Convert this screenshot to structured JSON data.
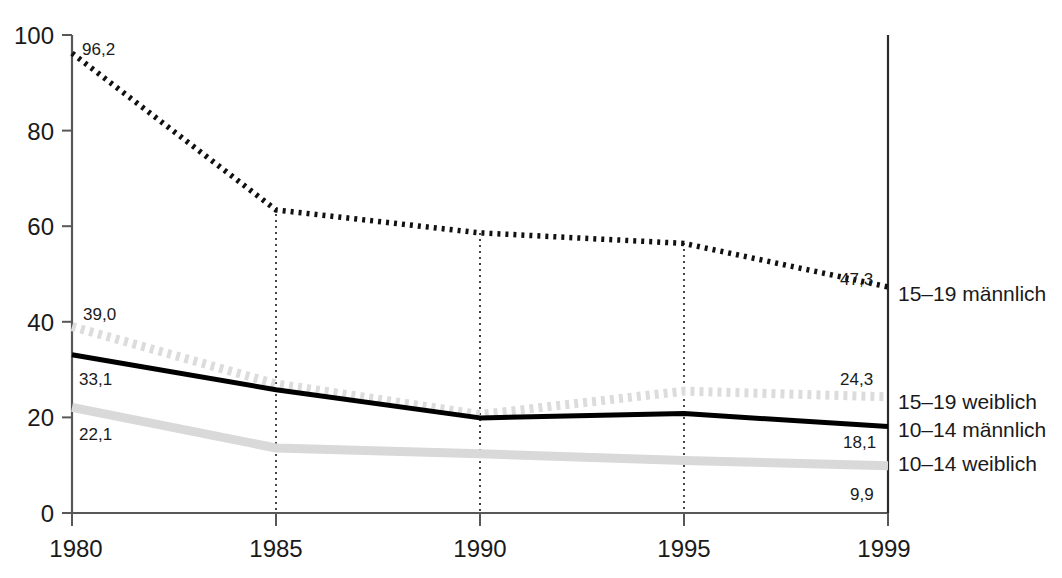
{
  "chart_data": {
    "type": "line",
    "title": "",
    "xlabel": "",
    "ylabel": "",
    "x": [
      1980,
      1985,
      1990,
      1995,
      1999
    ],
    "xtick_labels": [
      "1980",
      "1985",
      "1990",
      "1995",
      "1999"
    ],
    "ytick_labels": [
      "0",
      "20",
      "40",
      "60",
      "80",
      "100"
    ],
    "ytick_values": [
      0,
      20,
      40,
      60,
      80,
      100
    ],
    "ylim": [
      0,
      100
    ],
    "xlim": [
      1980,
      1999
    ],
    "grid": "vertical-dotted-at-xticks",
    "legend_position": "right-of-plot-at-line-ends",
    "series": [
      {
        "name": "15–19 männlich",
        "style": "dotted-black",
        "color": "#111111",
        "values": [
          96.2,
          63.4,
          58.6,
          56.4,
          47.3
        ],
        "start_label": "96,2",
        "end_label": "47,3"
      },
      {
        "name": "15–19 weiblich",
        "style": "dotted-light-gray",
        "color": "#dcdcdc",
        "values": [
          39.0,
          27.0,
          20.6,
          25.5,
          24.3
        ],
        "start_label": "39,0",
        "end_label": "24,3"
      },
      {
        "name": "10–14 männlich",
        "style": "solid-black",
        "color": "#000000",
        "values": [
          33.1,
          25.8,
          19.9,
          20.8,
          18.1
        ],
        "start_label": "33,1",
        "end_label": "18,1"
      },
      {
        "name": "10–14 weiblich",
        "style": "solid-light-gray",
        "color": "#d6d6d6",
        "values": [
          22.1,
          13.6,
          12.4,
          11.0,
          9.9
        ],
        "start_label": "22,1",
        "end_label": "9,9"
      }
    ],
    "data_labels": [
      {
        "text": "96,2",
        "series": "15–19 männlich",
        "anchor": "start-top"
      },
      {
        "text": "39,0",
        "series": "15–19 weiblich",
        "anchor": "start-top"
      },
      {
        "text": "33,1",
        "series": "10–14 männlich",
        "anchor": "start-bottom"
      },
      {
        "text": "22,1",
        "series": "10–14 weiblich",
        "anchor": "start-bottom"
      },
      {
        "text": "47,3",
        "series": "15–19 männlich",
        "anchor": "end-top"
      },
      {
        "text": "24,3",
        "series": "15–19 weiblich",
        "anchor": "end-top"
      },
      {
        "text": "18,1",
        "series": "10–14 männlich",
        "anchor": "end-bottom"
      },
      {
        "text": "9,9",
        "series": "10–14 weiblich",
        "anchor": "end-bottom"
      }
    ]
  },
  "axis": {
    "y_ticks": [
      {
        "label": "100",
        "value": 100
      },
      {
        "label": "80",
        "value": 80
      },
      {
        "label": "60",
        "value": 60
      },
      {
        "label": "40",
        "value": 40
      },
      {
        "label": "20",
        "value": 20
      },
      {
        "label": "0",
        "value": 0
      }
    ],
    "x_ticks": [
      {
        "label": "1980",
        "value": 1980
      },
      {
        "label": "1985",
        "value": 1985
      },
      {
        "label": "1990",
        "value": 1990
      },
      {
        "label": "1995",
        "value": 1995
      },
      {
        "label": "1999",
        "value": 1999
      }
    ]
  },
  "legend": {
    "items": [
      {
        "label": "15–19 männlich"
      },
      {
        "label": "15–19 weiblich"
      },
      {
        "label": "10–14 männlich"
      },
      {
        "label": "10–14 weiblich"
      }
    ]
  }
}
